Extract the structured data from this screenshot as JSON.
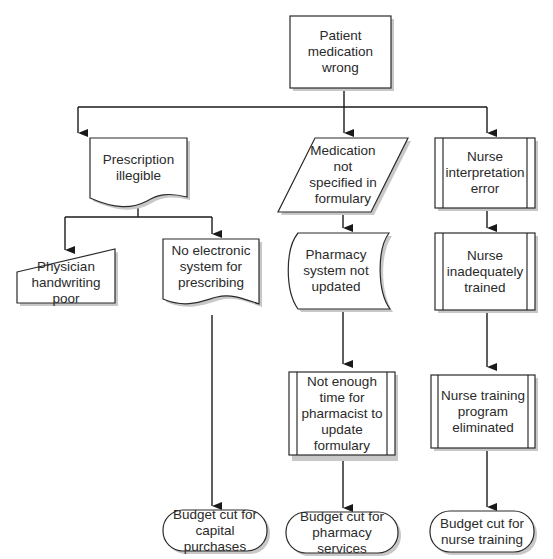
{
  "diagram": {
    "type": "cause-and-effect flowchart",
    "root": {
      "id": "patient-medication-wrong",
      "text": "Patient medication\nwrong",
      "shape": "rectangle"
    },
    "nodes": [
      {
        "id": "prescription-illegible",
        "text": "Prescription\nillegible",
        "shape": "document"
      },
      {
        "id": "medication-not-specified",
        "text": "Medication\nnot\nspecified in\nformulary",
        "shape": "parallelogram"
      },
      {
        "id": "nurse-interpretation-error",
        "text": "Nurse\ninterpretation\nerror",
        "shape": "predefined-process"
      },
      {
        "id": "physician-handwriting-poor",
        "text": "Physician\nhandwriting poor",
        "shape": "manual-input"
      },
      {
        "id": "no-electronic-system",
        "text": "No electronic\nsystem for\nprescribing",
        "shape": "document"
      },
      {
        "id": "pharmacy-system-not-updated",
        "text": "Pharmacy\nsystem not\nupdated",
        "shape": "stored-data"
      },
      {
        "id": "nurse-inadequately-trained",
        "text": "Nurse\ninadequately\ntrained",
        "shape": "predefined-process"
      },
      {
        "id": "not-enough-time",
        "text": "Not enough\ntime for\npharmacist to\nupdate\nformulary",
        "shape": "predefined-process"
      },
      {
        "id": "nurse-training-eliminated",
        "text": "Nurse training\nprogram\neliminated",
        "shape": "predefined-process"
      },
      {
        "id": "budget-cut-capital",
        "text": "Budget cut for\ncapital purchases",
        "shape": "terminator"
      },
      {
        "id": "budget-cut-pharmacy",
        "text": "Budget cut for\npharmacy services",
        "shape": "terminator"
      },
      {
        "id": "budget-cut-nurse",
        "text": "Budget cut for\nnurse training",
        "shape": "terminator"
      }
    ],
    "edges": [
      [
        "patient-medication-wrong",
        "prescription-illegible"
      ],
      [
        "patient-medication-wrong",
        "medication-not-specified"
      ],
      [
        "patient-medication-wrong",
        "nurse-interpretation-error"
      ],
      [
        "prescription-illegible",
        "physician-handwriting-poor"
      ],
      [
        "prescription-illegible",
        "no-electronic-system"
      ],
      [
        "no-electronic-system",
        "budget-cut-capital"
      ],
      [
        "medication-not-specified",
        "pharmacy-system-not-updated"
      ],
      [
        "pharmacy-system-not-updated",
        "not-enough-time"
      ],
      [
        "not-enough-time",
        "budget-cut-pharmacy"
      ],
      [
        "nurse-interpretation-error",
        "nurse-inadequately-trained"
      ],
      [
        "nurse-inadequately-trained",
        "nurse-training-eliminated"
      ],
      [
        "nurse-training-eliminated",
        "budget-cut-nurse"
      ]
    ]
  },
  "labels": {
    "root": "Patient medication\nwrong",
    "prescription": "Prescription\nillegible",
    "medication": "Medication\nnot\nspecified in\nformulary",
    "nurse_interp": "Nurse\ninterpretation\nerror",
    "physician": "Physician\nhandwriting poor",
    "no_electronic": "No electronic\nsystem for\nprescribing",
    "pharmacy_system": "Pharmacy\nsystem not\nupdated",
    "nurse_trained": "Nurse\ninadequately\ntrained",
    "not_enough_time": "Not enough\ntime for\npharmacist to\nupdate\nformulary",
    "nurse_program": "Nurse training\nprogram\neliminated",
    "budget_capital": "Budget cut for\ncapital purchases",
    "budget_pharmacy": "Budget cut for\npharmacy services",
    "budget_nurse": "Budget cut for\nnurse training"
  }
}
